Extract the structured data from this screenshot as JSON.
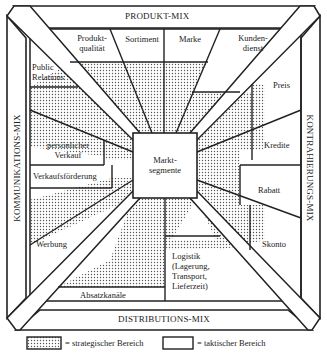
{
  "diagram": {
    "center": "Markt-\nsegmente",
    "center_line1": "Markt-",
    "center_line2": "segmente",
    "mixes": {
      "top": "PRODUKT-MIX",
      "bottom": "DISTRIBUTIONS-MIX",
      "left": "KOMMUNIKATIONS-MIX",
      "right": "KONTRAHIERUNGS-MIX"
    },
    "top_items": {
      "produktqualitaet_1": "Produkt-",
      "produktqualitaet_2": "qualität",
      "sortiment": "Sortiment",
      "marke": "Marke",
      "kundendienst_1": "Kunden-",
      "kundendienst_2": "dienst"
    },
    "left_items": {
      "public_relations_1": "Public",
      "public_relations_2": "Relations",
      "persoenlicher_verkauf_1": "persönlicher",
      "persoenlicher_verkauf_2": "Verkauf",
      "verkaufsfoerderung": "Verkaufsförderung",
      "werbung": "Werbung"
    },
    "right_items": {
      "preis": "Preis",
      "kredite": "Kredite",
      "rabatt": "Rabatt",
      "skonto": "Skonto"
    },
    "bottom_items": {
      "absatzkanaele": "Absatzkanäle",
      "logistik_1": "Logistik",
      "logistik_2": "(Lagerung,",
      "logistik_3": "Transport,",
      "logistik_4": "Lieferzeit)"
    },
    "colors": {
      "line": "#222222",
      "background": "#ffffff",
      "dot": "#555555"
    }
  },
  "legend": {
    "strategic": "= strategischer Bereich",
    "tactical": "= taktischer Bereich"
  }
}
